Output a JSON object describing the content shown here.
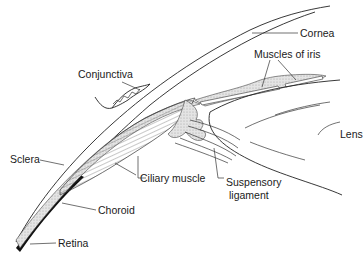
{
  "diagram": {
    "type": "anatomical-cross-section",
    "labels": [
      {
        "id": "cornea",
        "text": "Cornea"
      },
      {
        "id": "muscles-of-iris",
        "text": "Muscles of iris"
      },
      {
        "id": "conjunctiva",
        "text": "Conjunctiva"
      },
      {
        "id": "lens",
        "text": "Lens"
      },
      {
        "id": "sclera",
        "text": "Sclera"
      },
      {
        "id": "ciliary-muscle",
        "text": "Ciliary muscle"
      },
      {
        "id": "suspensory-ligament-1",
        "text": "Suspensory"
      },
      {
        "id": "suspensory-ligament-2",
        "text": "ligament"
      },
      {
        "id": "choroid",
        "text": "Choroid"
      },
      {
        "id": "retina",
        "text": "Retina"
      }
    ]
  }
}
